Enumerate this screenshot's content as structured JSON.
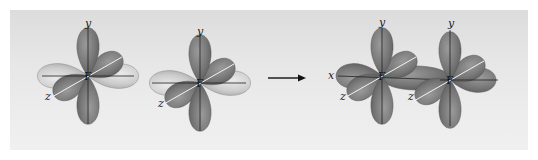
{
  "diagram": {
    "colors": {
      "panel_background": "#e6e6e6",
      "lobe_dark": "#7a7a7a",
      "lobe_light": "#c8c8c8",
      "axis_line": "#222222",
      "arrow": "#111111"
    },
    "before": {
      "atoms": [
        {
          "label": "F",
          "axes": {
            "y": "y",
            "z": "z"
          }
        },
        {
          "label": "F",
          "axes": {
            "y": "y",
            "z": "z"
          }
        }
      ]
    },
    "arrow": {
      "direction": "right"
    },
    "after": {
      "atoms": [
        {
          "label": "F",
          "axes": {
            "x": "x",
            "y": "y",
            "z": "z"
          }
        },
        {
          "label": "F",
          "axes": {
            "y": "y",
            "z": "z"
          }
        }
      ]
    }
  }
}
